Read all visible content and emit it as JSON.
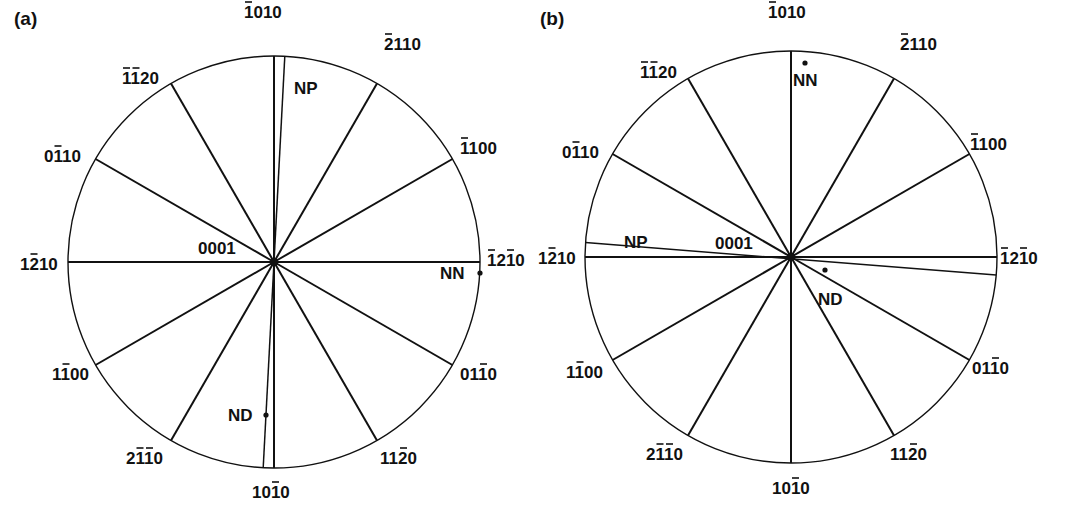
{
  "figure": {
    "panels": [
      {
        "id": "a",
        "label": "(a)",
        "center": [
          274,
          262
        ],
        "radius": 206,
        "center_label": "0001",
        "directions": [
          {
            "angle_deg": 90,
            "text": "1010",
            "bars": [
              0
            ],
            "label_pos": [
              244,
              18
            ]
          },
          {
            "angle_deg": 60,
            "text": "2110",
            "bars": [
              0
            ],
            "label_pos": [
              384,
              50
            ]
          },
          {
            "angle_deg": 30,
            "text": "1100",
            "bars": [
              0
            ],
            "label_pos": [
              460,
              154
            ]
          },
          {
            "angle_deg": 0,
            "text": "1210",
            "bars": [
              0,
              2
            ],
            "label_pos": [
              487,
              266
            ]
          },
          {
            "angle_deg": -30,
            "text": "0110",
            "bars": [
              2
            ],
            "label_pos": [
              460,
              380
            ]
          },
          {
            "angle_deg": -60,
            "text": "1120",
            "bars": [
              2
            ],
            "label_pos": [
              380,
              464
            ]
          },
          {
            "angle_deg": -90,
            "text": "1010",
            "bars": [
              2
            ],
            "label_pos": [
              252,
              498
            ]
          },
          {
            "angle_deg": -120,
            "text": "2110",
            "bars": [
              1,
              2
            ],
            "label_pos": [
              126,
              464
            ]
          },
          {
            "angle_deg": -150,
            "text": "1100",
            "bars": [
              1
            ],
            "label_pos": [
              52,
              380
            ]
          },
          {
            "angle_deg": 180,
            "text": "1210",
            "bars": [
              1
            ],
            "label_pos": [
              20,
              270
            ]
          },
          {
            "angle_deg": 150,
            "text": "0110",
            "bars": [
              1
            ],
            "label_pos": [
              44,
              162
            ]
          },
          {
            "angle_deg": 120,
            "text": "1120",
            "bars": [
              0,
              1
            ],
            "label_pos": [
              122,
              84
            ]
          }
        ],
        "special_lines": [
          {
            "name": "NP-ND axis",
            "from_angle_deg": 87,
            "to_angle_deg": -93
          }
        ],
        "markers": [
          {
            "name": "NN",
            "text": "NN",
            "point": [
              480,
              273
            ],
            "label_pos": [
              440,
              279
            ]
          },
          {
            "name": "ND",
            "text": "ND",
            "point": [
              266,
              415
            ],
            "label_pos": [
              228,
              421
            ]
          },
          {
            "name": "NP",
            "text": "NP",
            "point": null,
            "label_pos": [
              294,
              94
            ]
          }
        ]
      },
      {
        "id": "b",
        "label": "(b)",
        "center": [
          791,
          257
        ],
        "radius": 206,
        "center_label": "0001",
        "directions": [
          {
            "angle_deg": 90,
            "text": "1010",
            "bars": [
              0
            ],
            "label_pos": [
              768,
              18
            ]
          },
          {
            "angle_deg": 60,
            "text": "2110",
            "bars": [
              0
            ],
            "label_pos": [
              900,
              50
            ]
          },
          {
            "angle_deg": 30,
            "text": "1100",
            "bars": [
              0
            ],
            "label_pos": [
              970,
              150
            ]
          },
          {
            "angle_deg": 0,
            "text": "1210",
            "bars": [
              0,
              2
            ],
            "label_pos": [
              1000,
              264
            ]
          },
          {
            "angle_deg": -30,
            "text": "0110",
            "bars": [
              2
            ],
            "label_pos": [
              972,
              374
            ]
          },
          {
            "angle_deg": -60,
            "text": "1120",
            "bars": [
              2
            ],
            "label_pos": [
              890,
              460
            ]
          },
          {
            "angle_deg": -90,
            "text": "1010",
            "bars": [
              2
            ],
            "label_pos": [
              772,
              494
            ]
          },
          {
            "angle_deg": -120,
            "text": "2110",
            "bars": [
              1,
              2
            ],
            "label_pos": [
              646,
              460
            ]
          },
          {
            "angle_deg": -150,
            "text": "1100",
            "bars": [
              1
            ],
            "label_pos": [
              566,
              378
            ]
          },
          {
            "angle_deg": 180,
            "text": "1210",
            "bars": [
              1
            ],
            "label_pos": [
              538,
              264
            ]
          },
          {
            "angle_deg": 150,
            "text": "0110",
            "bars": [
              1
            ],
            "label_pos": [
              562,
              158
            ]
          },
          {
            "angle_deg": 120,
            "text": "1120",
            "bars": [
              0,
              1
            ],
            "label_pos": [
              640,
              78
            ]
          }
        ],
        "special_lines": [
          {
            "name": "NP-ND axis",
            "from_angle_deg": 176,
            "to_angle_deg": -5
          }
        ],
        "markers": [
          {
            "name": "NN",
            "text": "NN",
            "point": [
              805,
              63
            ],
            "label_pos": [
              793,
              86
            ]
          },
          {
            "name": "ND",
            "text": "ND",
            "point": [
              825,
              270
            ],
            "label_pos": [
              818,
              305
            ]
          },
          {
            "name": "NP",
            "text": "NP",
            "point": null,
            "label_pos": [
              624,
              248
            ]
          }
        ]
      }
    ]
  },
  "colors": {
    "ink": "#111111",
    "background": "#ffffff"
  }
}
